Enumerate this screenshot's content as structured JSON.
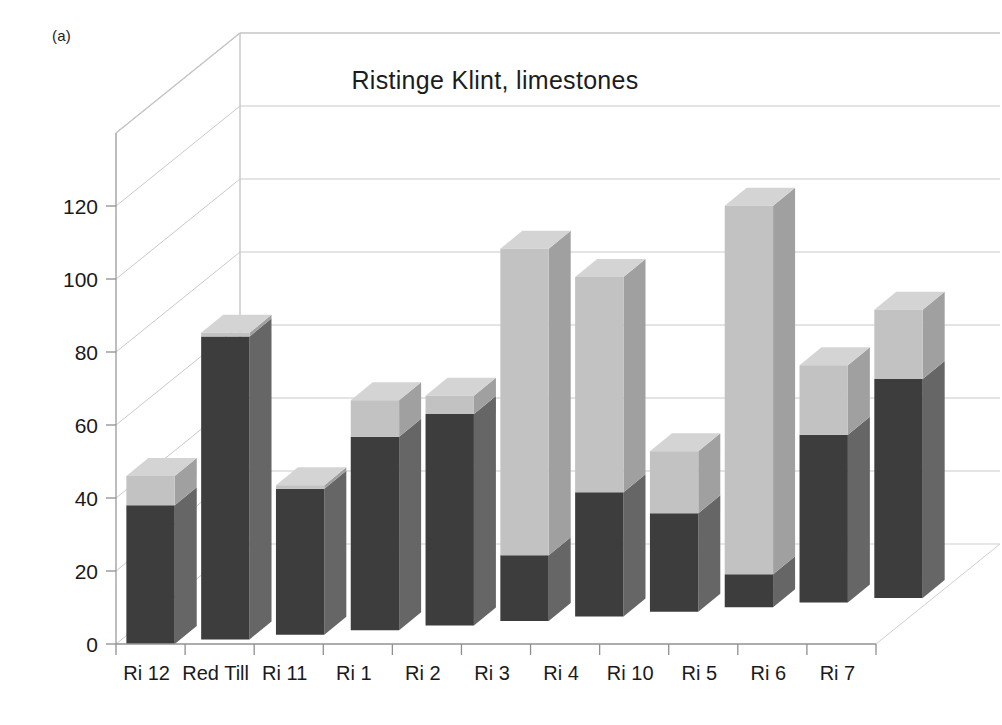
{
  "panel": {
    "label": "(a)"
  },
  "chart_data": {
    "type": "bar",
    "subtype": "stacked-3d-column",
    "title": "Ristinge Klint, limestones",
    "xlabel": "",
    "ylabel": "",
    "ylim": [
      0,
      140
    ],
    "yticks": [
      0,
      20,
      40,
      60,
      80,
      100,
      120
    ],
    "ytick_labels": [
      "0",
      "20",
      "40",
      "60",
      "80",
      "100",
      "120"
    ],
    "grid": true,
    "legend": "none",
    "categories": [
      "Ri 12",
      "Red Till",
      "Ri 11",
      "Ri 1",
      "Ri 2",
      "Ri 3",
      "Ri 4",
      "Ri 10",
      "Ri 5",
      "Ri 6",
      "Ri 7"
    ],
    "series": [
      {
        "name": "lower",
        "color": "#3d3d3d",
        "values": [
          38,
          83,
          40,
          53,
          58,
          18,
          34,
          27,
          9,
          46,
          60
        ]
      },
      {
        "name": "upper",
        "color": "#c2c2c2",
        "values": [
          8,
          1,
          1,
          10,
          5,
          84,
          59,
          17,
          101,
          19,
          19
        ]
      }
    ],
    "totals": [
      46,
      84,
      41,
      63,
      63,
      102,
      93,
      44,
      110,
      65,
      79
    ],
    "colors": {
      "front_dark": "#3d3d3d",
      "side_dark": "#666666",
      "top_dark": "#5a5a5a",
      "front_light": "#c2c2c2",
      "side_light": "#a0a0a0",
      "top_light": "#d4d4d4",
      "gridline": "#c9c9c9",
      "axis": "#9a9a9a",
      "text": "#1a1a1a",
      "background": "#ffffff"
    }
  }
}
